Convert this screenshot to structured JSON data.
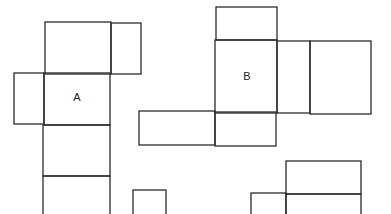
{
  "diagram": {
    "title": "",
    "nets": [
      {
        "id": "net-a",
        "label": "A",
        "label_pos": {
          "x": 77,
          "y": 98
        },
        "cells": [
          {
            "x": 45,
            "y": 22,
            "w": 66,
            "h": 52
          },
          {
            "x": 111,
            "y": 23,
            "w": 30,
            "h": 51
          },
          {
            "x": 14,
            "y": 73,
            "w": 30,
            "h": 51
          },
          {
            "x": 44,
            "y": 73,
            "w": 66,
            "h": 52
          },
          {
            "x": 43,
            "y": 125,
            "w": 67,
            "h": 51
          },
          {
            "x": 43,
            "y": 176,
            "w": 67,
            "h": 40
          }
        ]
      },
      {
        "id": "net-b",
        "label": "B",
        "label_pos": {
          "x": 247,
          "y": 77
        },
        "cells": [
          {
            "x": 216,
            "y": 7,
            "w": 61,
            "h": 33
          },
          {
            "x": 215,
            "y": 40,
            "w": 62,
            "h": 73
          },
          {
            "x": 277,
            "y": 41,
            "w": 33,
            "h": 72
          },
          {
            "x": 310,
            "y": 41,
            "w": 61,
            "h": 73
          },
          {
            "x": 139,
            "y": 111,
            "w": 76,
            "h": 34
          },
          {
            "x": 215,
            "y": 112,
            "w": 61,
            "h": 34
          }
        ]
      },
      {
        "id": "net-c",
        "label": "",
        "cells": [
          {
            "x": 133,
            "y": 190,
            "w": 33,
            "h": 30
          }
        ]
      },
      {
        "id": "net-d",
        "label": "",
        "cells": [
          {
            "x": 286,
            "y": 161,
            "w": 75,
            "h": 33
          },
          {
            "x": 251,
            "y": 193,
            "w": 35,
            "h": 25
          },
          {
            "x": 286,
            "y": 194,
            "w": 75,
            "h": 24
          }
        ]
      }
    ]
  }
}
